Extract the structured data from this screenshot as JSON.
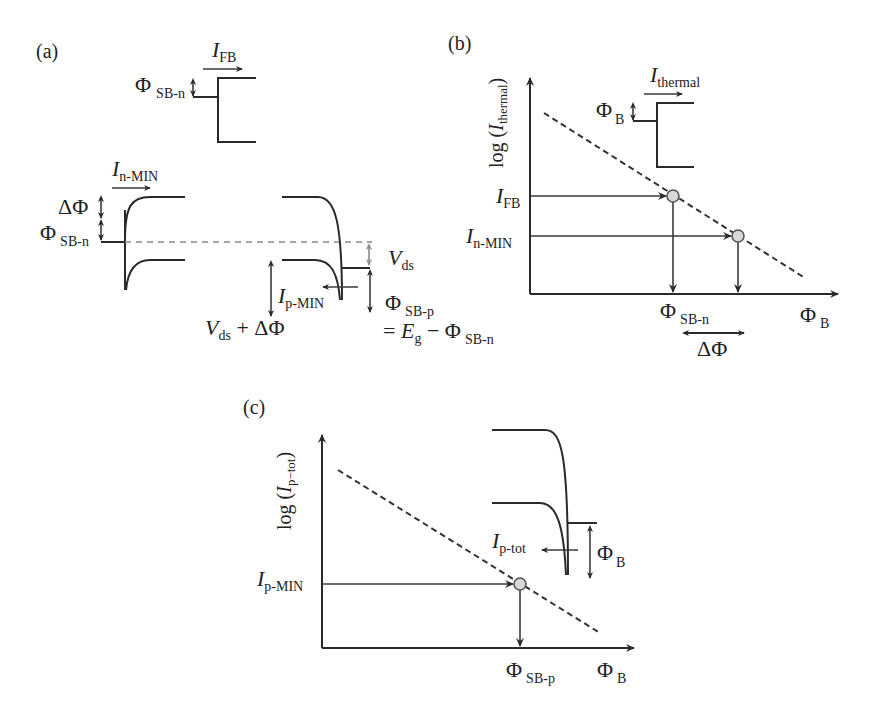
{
  "panels": {
    "a": {
      "label": "(a)",
      "top_inset": {
        "current": {
          "main": "I",
          "sub": "FB"
        },
        "barrier": {
          "main": "Φ",
          "sub": "SB-n"
        }
      },
      "band": {
        "current_n": {
          "main": "I",
          "sub": "n-MIN"
        },
        "delta_phi": "ΔΦ",
        "barrier_n": {
          "main": "Φ",
          "sub": "SB-n"
        },
        "vds": {
          "main": "V",
          "sub": "ds"
        },
        "current_p": {
          "main": "I",
          "sub": "p-MIN"
        },
        "vds_plus": {
          "main": "V",
          "sub": "ds",
          "suffix": " + ΔΦ"
        },
        "barrier_p": {
          "main": "Φ",
          "sub": "SB-p"
        },
        "barrier_p_eq": {
          "prefix": "= ",
          "main": "E",
          "sub": "g",
          "mid": " − Φ",
          "sub2": "SB-n"
        }
      }
    },
    "b": {
      "label": "(b)",
      "y_axis": {
        "prefix": "log (",
        "main": "I",
        "sub": "thermal",
        "suffix": ")"
      },
      "x_axis": {
        "main": "Φ",
        "sub": "B"
      },
      "inset": {
        "current": {
          "main": "I",
          "sub": "thermal"
        },
        "barrier": {
          "main": "Φ",
          "sub": "B"
        }
      },
      "points": [
        {
          "y_label": {
            "main": "I",
            "sub": "FB"
          },
          "x_label": {
            "main": "Φ",
            "sub": "SB-n"
          }
        },
        {
          "y_label": {
            "main": "I",
            "sub": "n-MIN"
          }
        }
      ],
      "delta": "ΔΦ"
    },
    "c": {
      "label": "(c)",
      "y_axis": {
        "prefix": "log (",
        "main": "I",
        "sub": "p−tot",
        "suffix": ")"
      },
      "x_axis": {
        "main": "Φ",
        "sub": "B"
      },
      "inset": {
        "current": {
          "main": "I",
          "sub": "p-tot"
        },
        "barrier": {
          "main": "Φ",
          "sub": "B"
        }
      },
      "points": [
        {
          "y_label": {
            "main": "I",
            "sub": "p-MIN"
          },
          "x_label": {
            "main": "Φ",
            "sub": "SB-p"
          }
        }
      ]
    }
  }
}
